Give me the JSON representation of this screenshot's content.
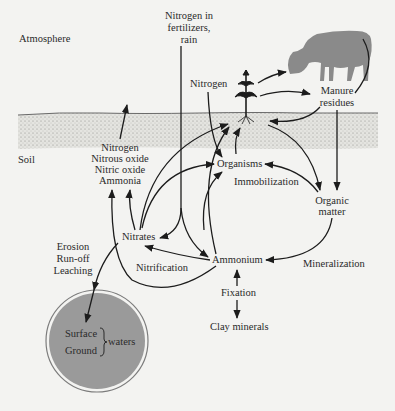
{
  "zones": {
    "atmosphere": "Atmosphere",
    "soil": "Soil"
  },
  "nodes": {
    "nitrogen_fertilizers": [
      "Nitrogen in",
      "fertilizers,",
      "rain"
    ],
    "nitrogen_atm": "Nitrogen",
    "manure_residues": [
      "Manure",
      "residues"
    ],
    "gases": [
      "Nitrogen",
      "Nitrous oxide",
      "Nitric oxide",
      "Ammonia"
    ],
    "organisms": "Organisms",
    "immobilization": "Immobilization",
    "organic_matter": [
      "Organic",
      "matter"
    ],
    "nitrates": "Nitrates",
    "erosion": [
      "Erosion",
      "Run-off",
      "Leaching"
    ],
    "nitrification": "Nitrification",
    "ammonium": "Ammonium",
    "mineralization": "Mineralization",
    "fixation": "Fixation",
    "clay_minerals": "Clay minerals",
    "waters": {
      "surface": "Surface",
      "ground": "Ground",
      "group_label": "waters"
    }
  },
  "icons": {
    "plant": "plant-icon",
    "cow": "cow-icon",
    "water_body": "water-body-icon"
  },
  "colors": {
    "background": "#f3f3f1",
    "ink": "#1c1c1c",
    "soil_fill": "#dcdcd8",
    "cow_fill": "#8a8a8a",
    "water_fill": "#9a9a9a"
  }
}
